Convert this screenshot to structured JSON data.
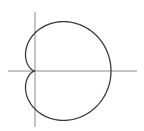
{
  "chart_data": {
    "type": "line",
    "title": "",
    "xlabel": "",
    "ylabel": "",
    "equation": "r = 1 + cos(theta)",
    "a": 1,
    "theta_range": [
      0,
      6.283185307
    ],
    "xlim": [
      -0.7,
      2.7
    ],
    "ylim": [
      -1.5,
      1.55
    ],
    "grid": false,
    "legend": "none",
    "series": [
      {
        "name": "cardioid",
        "color": "#3a3a3a"
      }
    ],
    "axes_color": "#8a8a8a"
  }
}
